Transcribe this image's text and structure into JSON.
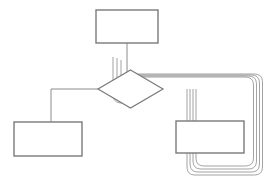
{
  "diagram": {
    "type": "flowchart",
    "canvas": {
      "width": 269,
      "height": 187,
      "background": "#ffffff"
    },
    "style": {
      "node_stroke": "#7a7a7a",
      "node_fill": "#ffffff",
      "node_stroke_width": 1.4,
      "connector_stroke": "#808080",
      "connector_stroke_width": 0.9,
      "loop_stroke": "#8a8a8a",
      "loop_stroke_width": 0.8,
      "arrow_fill": "#555555"
    },
    "nodes": [
      {
        "id": "top-process",
        "name": "top-process-box",
        "shape": "rectangle",
        "label": "",
        "x": 96,
        "y": 10,
        "width": 62,
        "height": 33
      },
      {
        "id": "decision",
        "name": "decision-diamond",
        "shape": "diamond",
        "label": "",
        "cx": 130.5,
        "cy": 89,
        "rx": 32.5,
        "ry": 19
      },
      {
        "id": "bottom-left-process",
        "name": "bottom-left-process-box",
        "shape": "rectangle",
        "label": "",
        "x": 14,
        "y": 122,
        "width": 68,
        "height": 34
      },
      {
        "id": "bottom-right-process",
        "name": "bottom-right-process-box",
        "shape": "rectangle",
        "label": "",
        "x": 176,
        "y": 121,
        "width": 68,
        "height": 32
      }
    ],
    "connectors": [
      {
        "id": "top-to-decision",
        "name": "connector-top-to-decision",
        "from": "top-process",
        "to": "decision",
        "arrowhead": false,
        "path": "M 127 23 L 127 89"
      },
      {
        "id": "decision-to-bottom-left",
        "name": "connector-decision-to-bottom-left",
        "from": "decision",
        "to": "bottom-left-process",
        "arrowhead": true,
        "path": "M 98 89 L 51 89 L 51 139"
      }
    ],
    "arrowheads": [
      {
        "name": "arrowhead-down-into-bottom-left-box",
        "points": "48,134 54,134 51,142"
      }
    ],
    "loops": {
      "name": "nested-loop-connectors",
      "count": 4,
      "description": "Four nested rounded-rectangle feedback paths from the decision node routed around the right side and back",
      "corner_radius": 7,
      "paths": [
        "M 134 89 C 134 80 136.5 77 143 77 L 244 77 C 251 77 253.5 79.5 253.5 86 L 253.5 157 C 253.5 163.5 251 166 244.5 166 L 205 166 C 198.5 166 196 163.5 196 157 L 196 89",
        "M 130 89 C 130 79 132.5 76 139 76 L 247 76 C 254 76 256.5 78.5 256.5 85 L 256.5 160 C 256.5 166.5 254 169 247.5 169 L 202 169 C 195.5 169 193 166.5 193 160 L 193 89",
        "M 126 89 C 126 78 128.5 75 135 75 L 250 75 C 257 75 259.5 77.5 259.5 84 L 259.5 163 C 259.5 169.5 257 172 250.5 172 L 199 172 C 192.5 172 190 169.5 190 163 L 190 89",
        "M 122 89 C 122 77 124.5 74 131 74 L 253 74 C 260 74 262.5 76.5 262.5 83 L 262.5 166 C 262.5 172.5 260 175 253.5 175 L 196 175 C 189.5 175 187 172.5 187 166 L 187 89"
      ],
      "loop_entry_curves": [
        "M 134 89 C 134 98 136.5 101 130 101 C 123.5 101 121 98 121 91.5 L 121 60",
        "M 130 89 C 130 99 132.5 102 126 102 C 119.5 102 117 99 117 92.5 L 117 58",
        "M 126 89 C 126 100 128.5 103 122 103 C 115.5 103 113 100 113 93.5 L 113 57"
      ]
    }
  }
}
